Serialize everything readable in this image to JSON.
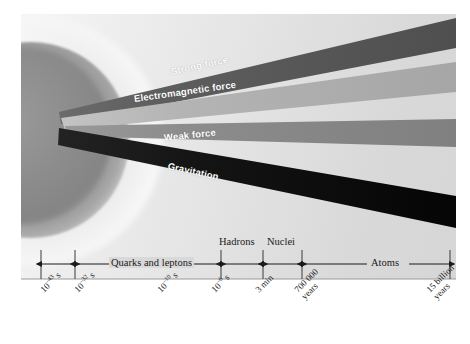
{
  "figure": {
    "background_color": "#ffffff",
    "panel_color": "#dcdcdc"
  },
  "sphere": {
    "name": "big-bang-sphere",
    "color": "#8c8c8c",
    "halo_color": "#ffffff"
  },
  "beams": [
    {
      "id": "strong",
      "label": "Strong force",
      "color": "#595959",
      "label_color": "#ffffff"
    },
    {
      "id": "electromagnetic",
      "label": "Electromagnetic force",
      "color": "#b0b0b0",
      "label_color": "#ffffff"
    },
    {
      "id": "weak",
      "label": "Weak force",
      "color": "#8a8a8a",
      "label_color": "#ffffff"
    },
    {
      "id": "gravitation",
      "label": "Gravitation",
      "color": "#111111",
      "label_color": "#ffffff"
    }
  ],
  "axis": {
    "eras": [
      {
        "id": "era-unnamed-first",
        "label": "",
        "position": "none"
      },
      {
        "id": "era-quarks",
        "label": "Quarks and leptons",
        "position": "inline"
      },
      {
        "id": "era-hadrons",
        "label": "Hadrons",
        "position": "above"
      },
      {
        "id": "era-nuclei",
        "label": "Nuclei",
        "position": "above"
      },
      {
        "id": "era-unnamed-last",
        "label": "",
        "position": "none"
      },
      {
        "id": "era-atoms",
        "label": "Atoms",
        "position": "inline"
      }
    ],
    "ticks": [
      {
        "id": "tick-1",
        "base": "10",
        "exponent": "–43",
        "unit": "s",
        "line2": ""
      },
      {
        "id": "tick-2",
        "base": "10",
        "exponent": "–32",
        "unit": "s",
        "line2": ""
      },
      {
        "id": "tick-3",
        "base": "10",
        "exponent": "–10",
        "unit": "s",
        "line2": ""
      },
      {
        "id": "tick-4",
        "base": "10",
        "exponent": "–6",
        "unit": "s",
        "line2": ""
      },
      {
        "id": "tick-5",
        "base": "",
        "exponent": "",
        "unit": "3 min",
        "line2": ""
      },
      {
        "id": "tick-6",
        "base": "",
        "exponent": "",
        "unit": "700 000",
        "line2": "years"
      },
      {
        "id": "tick-7",
        "base": "",
        "exponent": "",
        "unit": "15 billion",
        "line2": "years"
      }
    ]
  }
}
